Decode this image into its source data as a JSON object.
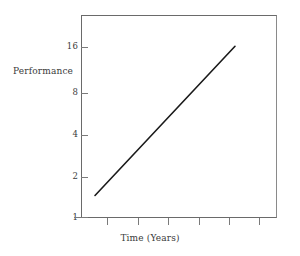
{
  "chart_data": {
    "type": "line",
    "title": "",
    "subtitle": "",
    "xlabel": "Time (Years)",
    "ylabel": "Performance",
    "yscale": "log2",
    "ylim": [
      1,
      24
    ],
    "ytick_labels": [
      "1",
      "2",
      "4",
      "8",
      "16"
    ],
    "ytick_values": [
      1,
      2,
      4,
      8,
      16
    ],
    "xlim": [
      0,
      7
    ],
    "xtick_labels": [
      "",
      "",
      "",
      "",
      "",
      ""
    ],
    "xtick_values": [
      1,
      2,
      3,
      4,
      5,
      6
    ],
    "grid": false,
    "legend": false,
    "series": [
      {
        "name": "Performance",
        "style": "solid",
        "color": "#1a1a1a",
        "x": [
          0.5,
          5.5
        ],
        "values": [
          1.45,
          17.0
        ],
        "points": [
          {
            "x": 0.5,
            "y": 1.45
          },
          {
            "x": 1.5,
            "y": 2.58
          },
          {
            "x": 2.5,
            "y": 4.58
          },
          {
            "x": 3.5,
            "y": 8.12
          },
          {
            "x": 4.5,
            "y": 14.4
          },
          {
            "x": 5.5,
            "y": 17.0
          }
        ],
        "description": "Straight line on a log2 vertical axis indicating exponential growth of performance over time"
      }
    ],
    "annotations": []
  },
  "axis": {
    "y_title": "Performance",
    "x_title": "Time (Years)"
  },
  "colors": {
    "line": "#1a1a1a",
    "frame": "#6a6a6a",
    "tick": "#7a7a7a",
    "text": "#3a3a3a",
    "background": "#ffffff"
  }
}
